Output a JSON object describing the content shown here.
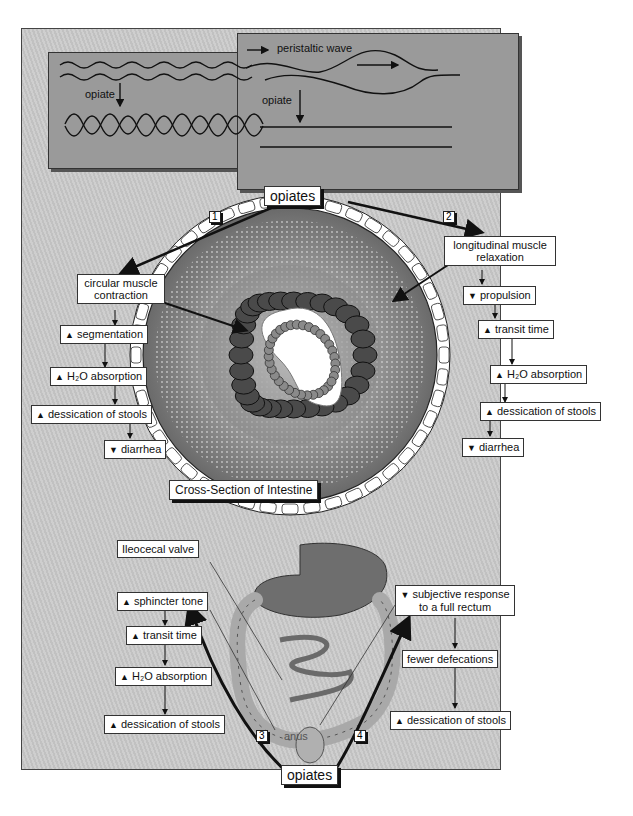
{
  "insets": {
    "circular": {
      "label": "opiate"
    },
    "longitudinal": {
      "wave_label": "peristaltic wave",
      "label": "opiate"
    }
  },
  "top_opiates": "opiates",
  "pathway_numbers": [
    "1",
    "2",
    "3",
    "4"
  ],
  "pathway1": {
    "head": "circular muscle\ncontraction",
    "head_line1": "circular muscle",
    "head_line2": "contraction",
    "steps": [
      {
        "dir": "up",
        "text": "segmentation"
      },
      {
        "dir": "up",
        "text": "H₂O absorption"
      },
      {
        "dir": "up",
        "text": "dessication of stools"
      },
      {
        "dir": "down",
        "text": "diarrhea"
      }
    ]
  },
  "pathway2": {
    "head_line1": "longitudinal muscle",
    "head_line2": "relaxation",
    "steps": [
      {
        "dir": "down",
        "text": "propulsion"
      },
      {
        "dir": "up",
        "text": "transit time"
      },
      {
        "dir": "up",
        "text": "H₂O absorption"
      },
      {
        "dir": "up",
        "text": "dessication of stools"
      },
      {
        "dir": "down",
        "text": "diarrhea"
      }
    ]
  },
  "cross_section_label": "Cross-Section of Intestine",
  "gi": {
    "ileocecal_label": "Ileocecal valve",
    "anus_label": "anus"
  },
  "pathway3": {
    "steps": [
      {
        "dir": "up",
        "text": "sphincter tone"
      },
      {
        "dir": "up",
        "text": "transit time"
      },
      {
        "dir": "up",
        "text": "H₂O absorption"
      },
      {
        "dir": "up",
        "text": "dessication of stools"
      }
    ]
  },
  "pathway4": {
    "head_line1": "subjective response",
    "head_line2": "to a full rectum",
    "head_dir": "down",
    "steps": [
      {
        "dir": "none",
        "text": "fewer defecations"
      },
      {
        "dir": "up",
        "text": "dessication of stools"
      }
    ]
  },
  "bottom_opiates": "opiates",
  "glyphs": {
    "up": "▲",
    "down": "▼"
  }
}
